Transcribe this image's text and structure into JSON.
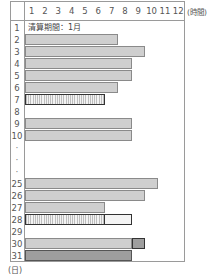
{
  "chart_data": {
    "type": "bar",
    "orientation": "horizontal",
    "title": "",
    "annotation": "清算期間：1月",
    "xlabel": "(時間)",
    "ylabel": "(日)",
    "x_ticks": [
      "1",
      "2",
      "3",
      "4",
      "5",
      "6",
      "7",
      "8",
      "9",
      "10",
      "11",
      "12"
    ],
    "xlim": [
      0,
      12
    ],
    "grid": false,
    "rows": [
      {
        "day": "1",
        "segments": []
      },
      {
        "day": "2",
        "segments": [
          {
            "start": 0,
            "end": 7,
            "style": "gray"
          }
        ]
      },
      {
        "day": "3",
        "segments": [
          {
            "start": 0,
            "end": 9,
            "style": "gray"
          }
        ]
      },
      {
        "day": "4",
        "segments": [
          {
            "start": 0,
            "end": 8,
            "style": "gray"
          }
        ]
      },
      {
        "day": "5",
        "segments": [
          {
            "start": 0,
            "end": 8,
            "style": "gray"
          }
        ]
      },
      {
        "day": "6",
        "segments": [
          {
            "start": 0,
            "end": 7,
            "style": "gray"
          }
        ]
      },
      {
        "day": "7",
        "segments": [
          {
            "start": 0,
            "end": 6,
            "style": "hatch"
          }
        ]
      },
      {
        "day": "8",
        "segments": []
      },
      {
        "day": "9",
        "segments": [
          {
            "start": 0,
            "end": 8,
            "style": "gray"
          }
        ]
      },
      {
        "day": "10",
        "segments": [
          {
            "start": 0,
            "end": 8,
            "style": "gray"
          }
        ]
      },
      {
        "day": ":",
        "segments": []
      },
      {
        "day": ":",
        "segments": []
      },
      {
        "day": ":",
        "segments": []
      },
      {
        "day": "25",
        "segments": [
          {
            "start": 0,
            "end": 10,
            "style": "gray"
          }
        ]
      },
      {
        "day": "26",
        "segments": [
          {
            "start": 0,
            "end": 9,
            "style": "gray"
          }
        ]
      },
      {
        "day": "27",
        "segments": [
          {
            "start": 0,
            "end": 6,
            "style": "gray"
          }
        ]
      },
      {
        "day": "28",
        "segments": [
          {
            "start": 0,
            "end": 6,
            "style": "hatch"
          },
          {
            "start": 6,
            "end": 8,
            "style": "dotted"
          }
        ]
      },
      {
        "day": "29",
        "segments": []
      },
      {
        "day": "30",
        "segments": [
          {
            "start": 0,
            "end": 8,
            "style": "gray"
          },
          {
            "start": 8,
            "end": 9,
            "style": "darkbox"
          }
        ]
      },
      {
        "day": "31",
        "segments": [
          {
            "start": 0,
            "end": 8,
            "style": "dark"
          }
        ]
      }
    ]
  },
  "labels": {
    "period": "清算期間：1月",
    "unit_hours": "(時間)",
    "unit_days": "(日)"
  }
}
